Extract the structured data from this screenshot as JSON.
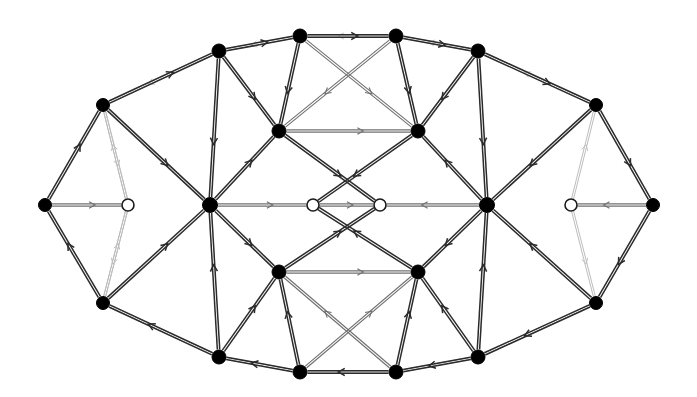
{
  "figure": {
    "type": "node-link-diagram",
    "width": 697,
    "height": 397,
    "background_color": "#ffffff",
    "node_fill_color": "#000000",
    "node_hollow_fill_color": "#ffffff",
    "edge_dark_color": "#2b2b2b",
    "edge_mid_color": "#6f6f6f",
    "edge_light_color": "#bdbdbd"
  },
  "legend": {
    "filled_node_label": "filled vertex",
    "hollow_node_label": "hollow vertex"
  },
  "graph": {
    "node_count": 24,
    "filled_node_count": 20,
    "hollow_node_count": 4,
    "directed": true,
    "nodes": [
      {
        "id": "n0",
        "x": 45,
        "y": 205,
        "type": "filled",
        "r": 6.5
      },
      {
        "id": "n1",
        "x": 103,
        "y": 105,
        "type": "filled",
        "r": 6.5
      },
      {
        "id": "n2",
        "x": 103,
        "y": 303,
        "type": "filled",
        "r": 6.5
      },
      {
        "id": "n3",
        "x": 219,
        "y": 51,
        "type": "filled",
        "r": 7.0
      },
      {
        "id": "n4",
        "x": 219,
        "y": 357,
        "type": "filled",
        "r": 7.0
      },
      {
        "id": "n5",
        "x": 300,
        "y": 36,
        "type": "filled",
        "r": 7.0
      },
      {
        "id": "n6",
        "x": 300,
        "y": 372,
        "type": "filled",
        "r": 7.0
      },
      {
        "id": "n7",
        "x": 396,
        "y": 36,
        "type": "filled",
        "r": 7.0
      },
      {
        "id": "n8",
        "x": 396,
        "y": 372,
        "type": "filled",
        "r": 7.0
      },
      {
        "id": "n9",
        "x": 478,
        "y": 51,
        "type": "filled",
        "r": 7.0
      },
      {
        "id": "n10",
        "x": 478,
        "y": 357,
        "type": "filled",
        "r": 7.0
      },
      {
        "id": "n11",
        "x": 596,
        "y": 105,
        "type": "filled",
        "r": 6.5
      },
      {
        "id": "n12",
        "x": 596,
        "y": 303,
        "type": "filled",
        "r": 6.5
      },
      {
        "id": "n13",
        "x": 653,
        "y": 205,
        "type": "filled",
        "r": 6.5
      },
      {
        "id": "n14",
        "x": 210,
        "y": 205,
        "type": "filled",
        "r": 7.5
      },
      {
        "id": "n15",
        "x": 487,
        "y": 205,
        "type": "filled",
        "r": 7.5
      },
      {
        "id": "n16",
        "x": 279,
        "y": 131,
        "type": "filled",
        "r": 7.0
      },
      {
        "id": "n17",
        "x": 418,
        "y": 131,
        "type": "filled",
        "r": 7.0
      },
      {
        "id": "n18",
        "x": 279,
        "y": 272,
        "type": "filled",
        "r": 7.0
      },
      {
        "id": "n19",
        "x": 418,
        "y": 272,
        "type": "filled",
        "r": 7.0
      },
      {
        "id": "h0",
        "x": 128,
        "y": 205,
        "type": "hollow",
        "r": 6.0
      },
      {
        "id": "h1",
        "x": 313,
        "y": 205,
        "type": "hollow",
        "r": 6.0
      },
      {
        "id": "h2",
        "x": 380,
        "y": 205,
        "type": "hollow",
        "r": 6.0
      },
      {
        "id": "h3",
        "x": 571,
        "y": 205,
        "type": "hollow",
        "r": 6.0
      }
    ],
    "edges_outer_ring": [
      {
        "from": "n0",
        "to": "n1",
        "shade": "dark"
      },
      {
        "from": "n1",
        "to": "n3",
        "shade": "dark"
      },
      {
        "from": "n3",
        "to": "n5",
        "shade": "dark"
      },
      {
        "from": "n5",
        "to": "n7",
        "shade": "dark"
      },
      {
        "from": "n7",
        "to": "n9",
        "shade": "dark"
      },
      {
        "from": "n9",
        "to": "n11",
        "shade": "dark"
      },
      {
        "from": "n11",
        "to": "n13",
        "shade": "dark"
      },
      {
        "from": "n13",
        "to": "n12",
        "shade": "dark"
      },
      {
        "from": "n12",
        "to": "n10",
        "shade": "dark"
      },
      {
        "from": "n10",
        "to": "n8",
        "shade": "dark"
      },
      {
        "from": "n8",
        "to": "n6",
        "shade": "dark"
      },
      {
        "from": "n6",
        "to": "n4",
        "shade": "dark"
      },
      {
        "from": "n4",
        "to": "n2",
        "shade": "dark"
      },
      {
        "from": "n2",
        "to": "n0",
        "shade": "dark"
      }
    ],
    "edges_spokes": [
      {
        "from": "n1",
        "to": "n14",
        "shade": "dark"
      },
      {
        "from": "n3",
        "to": "n14",
        "shade": "dark"
      },
      {
        "from": "n3",
        "to": "n16",
        "shade": "dark"
      },
      {
        "from": "n5",
        "to": "n16",
        "shade": "dark"
      },
      {
        "from": "n7",
        "to": "n17",
        "shade": "dark"
      },
      {
        "from": "n9",
        "to": "n17",
        "shade": "dark"
      },
      {
        "from": "n9",
        "to": "n15",
        "shade": "dark"
      },
      {
        "from": "n11",
        "to": "n15",
        "shade": "dark"
      },
      {
        "from": "n2",
        "to": "n14",
        "shade": "dark"
      },
      {
        "from": "n4",
        "to": "n14",
        "shade": "dark"
      },
      {
        "from": "n4",
        "to": "n18",
        "shade": "dark"
      },
      {
        "from": "n6",
        "to": "n18",
        "shade": "dark"
      },
      {
        "from": "n8",
        "to": "n19",
        "shade": "dark"
      },
      {
        "from": "n10",
        "to": "n19",
        "shade": "dark"
      },
      {
        "from": "n10",
        "to": "n15",
        "shade": "dark"
      },
      {
        "from": "n12",
        "to": "n15",
        "shade": "dark"
      }
    ],
    "edges_inner": [
      {
        "from": "n14",
        "to": "n16",
        "shade": "dark"
      },
      {
        "from": "n14",
        "to": "n18",
        "shade": "dark"
      },
      {
        "from": "n15",
        "to": "n17",
        "shade": "dark"
      },
      {
        "from": "n15",
        "to": "n19",
        "shade": "dark"
      },
      {
        "from": "n16",
        "to": "n17",
        "shade": "mid"
      },
      {
        "from": "n18",
        "to": "n19",
        "shade": "mid"
      },
      {
        "from": "n16",
        "to": "h2",
        "shade": "dark"
      },
      {
        "from": "n17",
        "to": "h1",
        "shade": "dark"
      },
      {
        "from": "n18",
        "to": "h2",
        "shade": "dark"
      },
      {
        "from": "n19",
        "to": "h1",
        "shade": "dark"
      },
      {
        "from": "h1",
        "to": "h2",
        "shade": "mid"
      },
      {
        "from": "n14",
        "to": "h1",
        "shade": "mid"
      },
      {
        "from": "n15",
        "to": "h2",
        "shade": "mid"
      },
      {
        "from": "n0",
        "to": "h0",
        "shade": "mid"
      },
      {
        "from": "n13",
        "to": "h3",
        "shade": "mid"
      },
      {
        "from": "h0",
        "to": "n1",
        "shade": "light"
      },
      {
        "from": "h0",
        "to": "n2",
        "shade": "light"
      },
      {
        "from": "h3",
        "to": "n11",
        "shade": "light"
      },
      {
        "from": "h3",
        "to": "n12",
        "shade": "light"
      },
      {
        "from": "n5",
        "to": "n17",
        "shade": "mid"
      },
      {
        "from": "n7",
        "to": "n16",
        "shade": "mid"
      },
      {
        "from": "n6",
        "to": "n19",
        "shade": "mid"
      },
      {
        "from": "n8",
        "to": "n18",
        "shade": "mid"
      }
    ],
    "edges_light_quads": [
      {
        "from": "n1",
        "to": "h0",
        "shade": "light"
      },
      {
        "from": "n3",
        "to": "n1",
        "shade": "light"
      },
      {
        "from": "n5",
        "to": "n3",
        "shade": "light"
      },
      {
        "from": "n7",
        "to": "n5",
        "shade": "light"
      },
      {
        "from": "n9",
        "to": "n7",
        "shade": "light"
      },
      {
        "from": "n11",
        "to": "n9",
        "shade": "light"
      },
      {
        "from": "n2",
        "to": "h0",
        "shade": "light"
      },
      {
        "from": "n4",
        "to": "n2",
        "shade": "light"
      },
      {
        "from": "n6",
        "to": "n4",
        "shade": "light"
      },
      {
        "from": "n8",
        "to": "n6",
        "shade": "light"
      },
      {
        "from": "n10",
        "to": "n8",
        "shade": "light"
      },
      {
        "from": "n12",
        "to": "n10",
        "shade": "light"
      }
    ]
  }
}
